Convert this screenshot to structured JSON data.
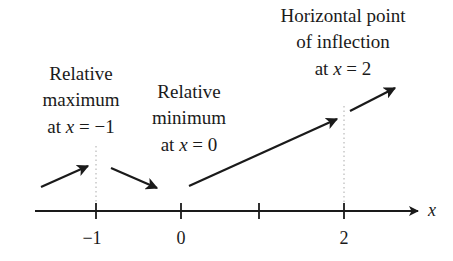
{
  "diagram": {
    "type": "number-line-sign-diagram",
    "axis": {
      "variable_label": "x",
      "tick_labels": [
        "−1",
        "0",
        "",
        "2"
      ],
      "color": "#1a1a1a"
    },
    "annotations": [
      {
        "lines": [
          "Relative",
          "maximum",
          "at x = −1"
        ],
        "line3_prefix": "at ",
        "line3_var": "x",
        "line3_suffix": " = −1"
      },
      {
        "lines": [
          "Relative",
          "minimum",
          "at x = 0"
        ],
        "line3_prefix": "at ",
        "line3_var": "x",
        "line3_suffix": " = 0"
      },
      {
        "lines": [
          "Horizontal point",
          "of inflection",
          "at x = 2"
        ],
        "line3_prefix": "at ",
        "line3_var": "x",
        "line3_suffix": " = 2"
      }
    ],
    "arrows": [
      {
        "direction": "increasing",
        "interval": "x < -1"
      },
      {
        "direction": "decreasing",
        "interval": "-1 < x < 0"
      },
      {
        "direction": "increasing",
        "interval": "0 < x < 2"
      },
      {
        "direction": "increasing",
        "interval": "x > 2"
      }
    ],
    "dotted_guides_at": [
      "−1",
      "2"
    ],
    "colors": {
      "ink": "#1a1a1a",
      "guide": "#aaaaaa",
      "background": "#ffffff"
    }
  }
}
